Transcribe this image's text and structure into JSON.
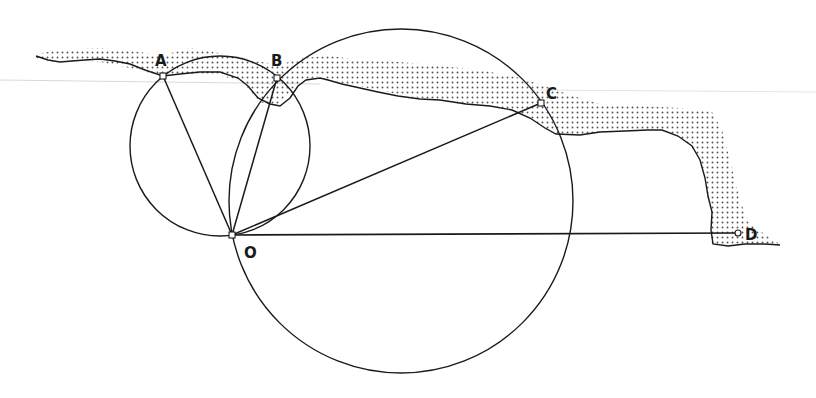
{
  "diagram": {
    "type": "geometry-construction",
    "colors": {
      "line": "#1a1a1a",
      "stipple": "#555555",
      "background": "#ffffff"
    },
    "points": [
      {
        "id": "A",
        "label": "A",
        "x": 163,
        "y": 76,
        "label_x": 155,
        "label_y": 66
      },
      {
        "id": "B",
        "label": "B",
        "x": 277,
        "y": 78,
        "label_x": 273,
        "label_y": 66
      },
      {
        "id": "C",
        "label": "C",
        "x": 541,
        "y": 103,
        "label_x": 546,
        "label_y": 99
      },
      {
        "id": "D",
        "label": "D",
        "x": 738,
        "y": 233,
        "label_x": 745,
        "label_y": 238
      },
      {
        "id": "O",
        "label": "O",
        "x": 232,
        "y": 235,
        "label_x": 244,
        "label_y": 258
      }
    ],
    "segments": [
      {
        "from": "O",
        "to": "A"
      },
      {
        "from": "O",
        "to": "B"
      },
      {
        "from": "O",
        "to": "C"
      },
      {
        "from": "O",
        "to": "D"
      }
    ],
    "circles": [
      {
        "name": "small-circle",
        "through": [
          "A",
          "B",
          "O"
        ],
        "cx": 220,
        "cy": 146,
        "r": 90
      },
      {
        "name": "large-circle",
        "through": [
          "B",
          "C",
          "O"
        ],
        "cx": 401,
        "cy": 201,
        "r": 172
      }
    ]
  }
}
